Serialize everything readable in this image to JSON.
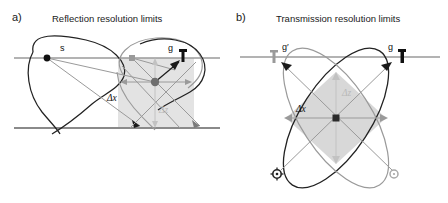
{
  "figure": {
    "kind": "two-panel-scientific-diagram",
    "background": "#ffffff",
    "width": 448,
    "height": 203
  },
  "colors": {
    "ink": "#1a1a1a",
    "dark_curve": "#222222",
    "light_curve": "#9a9a9a",
    "mid_gray": "#8c8c8c",
    "cell_fill_light": "#e3e3e3",
    "cell_fill_dark": "#cfcfcf",
    "surface_line": "#9a9a9a",
    "reflector_line": "#8a8a8a",
    "delta_z_label": "#b9b9b9",
    "delta_x_label": "#111111"
  },
  "panel_a": {
    "letter": "a)",
    "title": "Reflection resolution limits",
    "geometry": "reflection",
    "markers": [
      {
        "name": "source",
        "label": "s",
        "type": "filled-dot-black",
        "x": 47,
        "y": 58
      },
      {
        "name": "geophone-left",
        "label": "",
        "type": "filled-square-gray",
        "x": 132,
        "y": 58
      },
      {
        "name": "geophone-right",
        "label": "g",
        "type": "geophone-bar-black",
        "x": 180,
        "y": 57
      },
      {
        "name": "image-point",
        "label": "",
        "type": "filled-dot-gray",
        "x": 155,
        "y": 82
      }
    ],
    "annotations": [
      {
        "name": "delta-x",
        "label": "Δx",
        "style": "dark",
        "x": 113,
        "y": 98
      },
      {
        "name": "delta-z",
        "label": "Δz",
        "style": "light",
        "x": 165,
        "y": 110
      }
    ],
    "lines": [
      {
        "name": "surface-line",
        "y": 58
      },
      {
        "name": "reflector-line",
        "y": 128
      }
    ],
    "resolution_cell": {
      "name": "resolution-cell-rect",
      "shape": "rectangle",
      "x": 118,
      "y": 58,
      "w": 76,
      "h": 70,
      "fill": "#e3e3e3"
    }
  },
  "panel_b": {
    "letter": "b)",
    "title": "Transmission resolution limits",
    "geometry": "transmission",
    "markers": [
      {
        "name": "geophone-left",
        "label": "g′",
        "type": "geophone-bar-gray",
        "x": 273,
        "y": 57
      },
      {
        "name": "geophone-right",
        "label": "g",
        "type": "geophone-bar-black",
        "x": 399,
        "y": 57
      },
      {
        "name": "source-left",
        "label": "",
        "type": "starburst-circle-dark",
        "x": 277,
        "y": 174
      },
      {
        "name": "source-right",
        "label": "",
        "type": "starburst-circle-light",
        "x": 394,
        "y": 174
      },
      {
        "name": "image-point",
        "label": "",
        "type": "filled-square-dark",
        "x": 336,
        "y": 118
      }
    ],
    "annotations": [
      {
        "name": "delta-x",
        "label": "Δx",
        "style": "dark",
        "x": 300,
        "y": 113
      },
      {
        "name": "delta-z",
        "label": "Δz",
        "style": "light",
        "x": 344,
        "y": 93
      }
    ],
    "lines": [
      {
        "name": "surface-line",
        "y": 57
      }
    ],
    "resolution_cell": {
      "name": "resolution-cell-diamond",
      "shape": "diamond",
      "cx": 336,
      "cy": 118,
      "rx": 50,
      "ry": 46,
      "fill": "#d8d8d8"
    },
    "ellipses": [
      {
        "name": "ellipse-dark",
        "rotation_deg": -55,
        "rx": 78,
        "ry": 34,
        "stroke": "#222222"
      },
      {
        "name": "ellipse-light",
        "rotation_deg": 55,
        "rx": 78,
        "ry": 34,
        "stroke": "#9a9a9a"
      }
    ]
  }
}
